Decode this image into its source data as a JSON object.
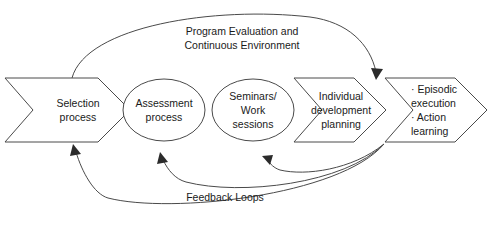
{
  "diagram": {
    "background_color": "#ffffff",
    "line_color": "#4a4a4a",
    "text_color": "#1a1a1a",
    "nodes": [
      {
        "id": "selection",
        "shape": "chevron",
        "label": "Selection\nprocess"
      },
      {
        "id": "assessment",
        "shape": "ellipse",
        "label": "Assessment\nprocess"
      },
      {
        "id": "seminars",
        "shape": "ellipse",
        "label": "Seminars/\nWork\nsessions"
      },
      {
        "id": "individual",
        "shape": "chevron",
        "label": "Individual\ndevelopment\nplanning"
      },
      {
        "id": "execution",
        "shape": "chevron",
        "label": "· Episodic\n   execution\n· Action\n   learning"
      }
    ],
    "annotations": [
      {
        "id": "program-evaluation",
        "label": "Program Evaluation and\nContinuous Environment"
      },
      {
        "id": "feedback-loops",
        "label": "Feedback Loops"
      }
    ]
  }
}
